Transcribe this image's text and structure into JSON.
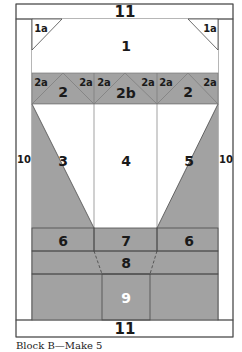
{
  "colors": {
    "frame": "#a9a9a9",
    "gray": "#a2a2a2",
    "dark": "#5f5f5f",
    "white": "#ffffff",
    "line": "#4a4a4a"
  },
  "labels": {
    "top_border": "11",
    "bottom_border": "11",
    "left_border": "10",
    "right_border": "10",
    "corner_left": "1a",
    "corner_right": "1a",
    "top_piece": "1",
    "unit_left": "2",
    "unit_center": "2b",
    "unit_right": "2",
    "unit_corners": [
      "2a",
      "2a",
      "2a",
      "2a",
      "2a",
      "2a"
    ],
    "left_side": "3",
    "center_panel": "4",
    "right_side": "5",
    "lower_left": "6",
    "lower_center": "7",
    "lower_right": "6",
    "band": "8",
    "base_block": "9"
  },
  "caption": "Block B—Make 5"
}
